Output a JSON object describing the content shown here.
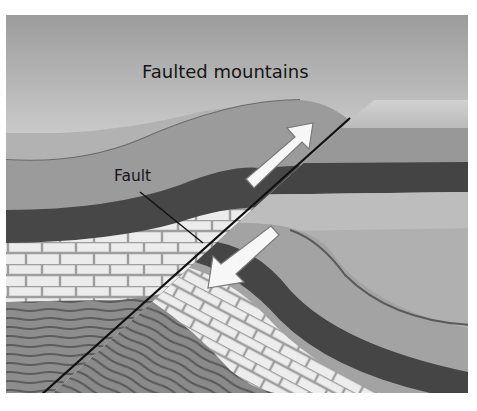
{
  "title": "Faulted mountains",
  "labels": {
    "fault": "Fault"
  },
  "arrows": [
    {
      "name": "up-thrust-arrow",
      "direction": "up-right"
    },
    {
      "name": "down-slip-arrow",
      "direction": "down-left"
    }
  ],
  "colors": {
    "sky_top": "#9a9a9a",
    "sky_bottom": "#e4e4e4",
    "surface_layer": "#a9a9a9",
    "upper_layer": "#8f8f8f",
    "dark_layer": "#4a4a4a",
    "light_layer": "#c6c6c6",
    "limestone_fill": "#ededed",
    "limestone_lines": "#9c9c9c",
    "shale": "#8a8a8a",
    "shale_lines": "#5a5a5a",
    "arrow_fill": "#f7f7f7",
    "fault_line": "#111111"
  }
}
